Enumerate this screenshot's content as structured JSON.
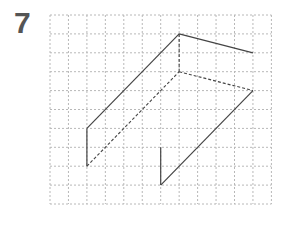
{
  "problem": {
    "number": "7"
  },
  "grid": {
    "x0": 50,
    "y0": 15,
    "cols": 12,
    "rows": 10,
    "cell_w": 18.45,
    "cell_h": 18.9,
    "color": "#b8b8b8"
  },
  "figure": {
    "stroke_color": "#444444",
    "solid_segments": [
      [
        2,
        6,
        2,
        8
      ],
      [
        2,
        6,
        7,
        1
      ],
      [
        7,
        1,
        11,
        2
      ],
      [
        11,
        4,
        6,
        9
      ],
      [
        6,
        7,
        6,
        9
      ]
    ],
    "dashed_segments": [
      [
        7,
        1,
        7,
        3
      ],
      [
        7,
        3,
        11,
        4
      ],
      [
        2,
        8,
        7,
        3
      ]
    ]
  }
}
